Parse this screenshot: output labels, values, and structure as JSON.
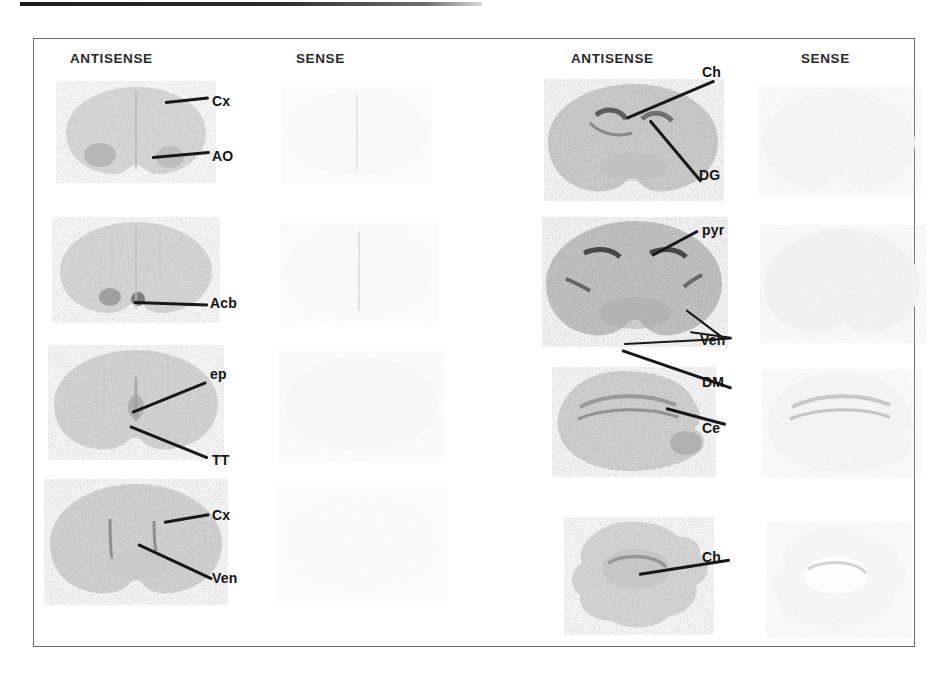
{
  "figure": {
    "frame_color": "#6d6d6d",
    "background": "#ffffff"
  },
  "panels": [
    {
      "id": "left-panel",
      "headers": [
        {
          "id": "left-antisense",
          "label": "ANTISENSE"
        },
        {
          "id": "left-sense",
          "label": "SENSE"
        }
      ],
      "rows": [
        {
          "id": "left-row-1",
          "annotations": [
            {
              "id": "cx-1",
              "label": "Cx"
            },
            {
              "id": "ao-1",
              "label": "AO"
            }
          ]
        },
        {
          "id": "left-row-2",
          "annotations": [
            {
              "id": "acb-1",
              "label": "Acb"
            }
          ]
        },
        {
          "id": "left-row-3",
          "annotations": [
            {
              "id": "ep-1",
              "label": "ep"
            },
            {
              "id": "tt-1",
              "label": "TT"
            }
          ]
        },
        {
          "id": "left-row-4",
          "annotations": [
            {
              "id": "cx-2",
              "label": "Cx"
            },
            {
              "id": "ven-1",
              "label": "Ven"
            }
          ]
        }
      ]
    },
    {
      "id": "right-panel",
      "headers": [
        {
          "id": "right-antisense",
          "label": "ANTISENSE"
        },
        {
          "id": "right-sense",
          "label": "SENSE"
        }
      ],
      "rows": [
        {
          "id": "right-row-1",
          "annotations": [
            {
              "id": "ch-1",
              "label": "Ch"
            },
            {
              "id": "dg-1",
              "label": "DG"
            }
          ]
        },
        {
          "id": "right-row-2",
          "annotations": [
            {
              "id": "pyr-1",
              "label": "pyr"
            },
            {
              "id": "ven-2",
              "label": "Ven"
            },
            {
              "id": "dm-1",
              "label": "DM"
            }
          ]
        },
        {
          "id": "right-row-3",
          "annotations": [
            {
              "id": "ce-1",
              "label": "Ce"
            }
          ]
        },
        {
          "id": "right-row-4",
          "annotations": [
            {
              "id": "ch-2",
              "label": "Ch"
            }
          ]
        }
      ]
    }
  ],
  "legend_terms": {
    "Cx": "Cx",
    "AO": "AO",
    "Acb": "Acb",
    "ep": "ep",
    "TT": "TT",
    "Ven": "Ven",
    "Ch": "Ch",
    "DG": "DG",
    "pyr": "pyr",
    "DM": "DM",
    "Ce": "Ce"
  }
}
